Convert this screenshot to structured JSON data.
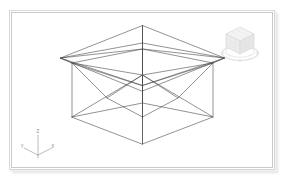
{
  "viewport": {
    "name": "3d-modeling-viewport",
    "background_color": "#ffffff",
    "border_color": "#c9c9c9",
    "wireframe_color": "#4a4a4a",
    "display_mode": "Wireframe",
    "projection": "Isometric"
  },
  "axis_triad": {
    "label": "Axis Triad",
    "axes": [
      {
        "name": "z",
        "label": "Z"
      },
      {
        "name": "y",
        "label": "Y"
      },
      {
        "name": "x",
        "label": "X"
      }
    ],
    "color": "#8c8c8c"
  },
  "view_cube": {
    "label": "ViewCube",
    "current_view": "Isometric",
    "compass_ring": true,
    "color": "#c8c8c8"
  },
  "caption": {
    "text": ""
  },
  "model": {
    "name": "box-with-hipped-roof-and-inverted-pyramid",
    "wireframe_color": "#4a4a4a",
    "line_width": 0.6,
    "parts": [
      {
        "name": "roof-pyramid",
        "edges": 8
      },
      {
        "name": "box-walls",
        "edges": 8
      },
      {
        "name": "inverted-pyramid-funnel",
        "edges": 8
      },
      {
        "name": "center-axis",
        "edges": 1
      }
    ],
    "geometry": {
      "apex": {
        "x": 130.5,
        "y": 12.5
      },
      "center_mid": {
        "x": 130.5,
        "y": 62.0
      },
      "bottom_tip": {
        "x": 130.5,
        "y": 131.0
      },
      "roof_eaves": [
        {
          "name": "left",
          "x": 48.5,
          "y": 45.0
        },
        {
          "name": "back",
          "x": 130.5,
          "y": 30.0
        },
        {
          "name": "right",
          "x": 212.5,
          "y": 45.0
        },
        {
          "name": "front",
          "x": 130.5,
          "y": 78.0
        }
      ],
      "rim_top": [
        {
          "name": "left",
          "x": 60.0,
          "y": 50.0
        },
        {
          "name": "back",
          "x": 130.5,
          "y": 36.0
        },
        {
          "name": "right",
          "x": 201.0,
          "y": 50.0
        },
        {
          "name": "front",
          "x": 130.5,
          "y": 72.5
        }
      ],
      "box_bottom": [
        {
          "name": "left",
          "x": 60.0,
          "y": 104.0
        },
        {
          "name": "back",
          "x": 130.5,
          "y": 90.0
        },
        {
          "name": "right",
          "x": 201.0,
          "y": 104.0
        },
        {
          "name": "front",
          "x": 130.5,
          "y": 131.0
        }
      ]
    }
  }
}
